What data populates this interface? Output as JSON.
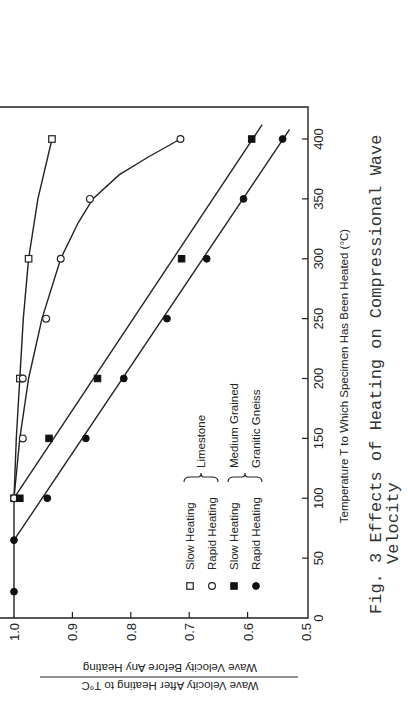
{
  "chart_data": {
    "type": "line",
    "caption_label": "Fig. 3",
    "caption_line1": "Fig. 3  Effects of Heating on Compressional Wave",
    "caption_line2": "Velocity",
    "xlabel": "Temperature T to Which Specimen Has Been Heated (°C)",
    "ylabel_line1": "Wave Velocity After Heating to T°C",
    "ylabel_line2": "Wave Velocity Before Any Heating",
    "xlim": [
      0,
      420
    ],
    "ylim": [
      0.5,
      1.02
    ],
    "x_ticks": [
      0,
      50,
      100,
      150,
      200,
      250,
      300,
      350,
      400
    ],
    "x_tick_labels": [
      "0",
      "50",
      "100",
      "150",
      "200",
      "250",
      "300",
      "350",
      "400"
    ],
    "y_ticks": [
      0.5,
      0.6,
      0.7,
      0.8,
      0.9,
      1.0
    ],
    "y_tick_labels": [
      "0.5",
      "0.6",
      "0.7",
      "0.8",
      "0.9",
      "1.0"
    ],
    "grid": false,
    "orientation_note": "page rotated 90° counter-clockwise",
    "legend": {
      "position": "lower-left inside plot",
      "entries": [
        {
          "marker": "open-square",
          "label": "Slow Heating"
        },
        {
          "marker": "open-circle",
          "label": "Rapid Heating"
        },
        {
          "marker": "filled-square",
          "label": "Slow Heating"
        },
        {
          "marker": "filled-circle",
          "label": "Rapid Heating"
        }
      ],
      "groups": [
        {
          "label": "Limestone",
          "entries": [
            0,
            1
          ]
        },
        {
          "label": "Medium Grained Granitic Gneiss",
          "label_line1": "Medium Grained",
          "label_line2": "Granitic Gneiss",
          "entries": [
            2,
            3
          ]
        }
      ]
    },
    "series": [
      {
        "name": "Limestone - Slow Heating",
        "marker": "open-square",
        "x": [
          100,
          200,
          300,
          400
        ],
        "y": [
          1.0,
          0.99,
          0.975,
          0.935
        ],
        "fit": "curve"
      },
      {
        "name": "Limestone - Rapid Heating",
        "marker": "open-circle",
        "x": [
          100,
          150,
          200,
          250,
          300,
          350,
          400
        ],
        "y": [
          1.0,
          0.985,
          0.985,
          0.945,
          0.92,
          0.87,
          0.715
        ],
        "fit": "curve"
      },
      {
        "name": "Medium Grained Granitic Gneiss - Slow Heating",
        "marker": "filled-square",
        "x": [
          100,
          150,
          200,
          300,
          400
        ],
        "y": [
          0.99,
          0.94,
          0.857,
          0.713,
          0.593
        ],
        "fit": "line from (100,1.0) to (420,0.57)"
      },
      {
        "name": "Medium Grained Granitic Gneiss - Rapid Heating",
        "marker": "filled-circle",
        "x": [
          22,
          65,
          100,
          150,
          200,
          250,
          300,
          350,
          400
        ],
        "y": [
          1.0,
          1.0,
          0.943,
          0.877,
          0.812,
          0.738,
          0.67,
          0.607,
          0.54
        ],
        "fit": "line from (65,1.0) to (410,0.525)"
      }
    ]
  }
}
